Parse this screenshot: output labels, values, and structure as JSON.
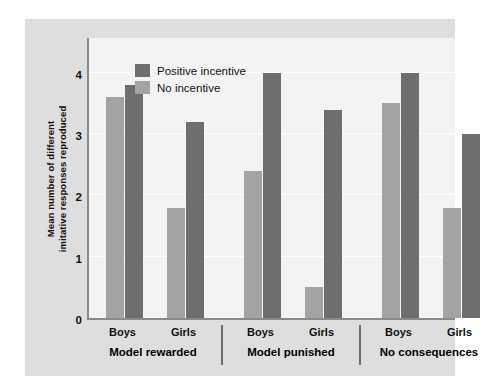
{
  "chart_data": {
    "type": "bar",
    "title": "",
    "subtitle": "",
    "xlabel": "",
    "ylabel_line1": "Mean number of different",
    "ylabel_line2": "imitative responses reproduced",
    "ylim": [
      0,
      4.6
    ],
    "yticks": [
      0,
      1,
      2,
      3,
      4
    ],
    "ytick_labels": [
      "0",
      "1",
      "2",
      "3",
      "4"
    ],
    "grid": true,
    "legend_position": "top-left",
    "colors": {
      "positive_incentive": "#6e6e6e",
      "no_incentive": "#a3a3a3",
      "plot_background": "#f3f3f3",
      "card_background": "#dedede",
      "axis": "#8a8a8a",
      "text": "#111111"
    },
    "legend": [
      {
        "name": "Positive incentive",
        "color": "#6e6e6e"
      },
      {
        "name": "No incentive",
        "color": "#a3a3a3"
      }
    ],
    "series": [
      {
        "name": "No incentive",
        "values": [
          3.6,
          1.8,
          2.4,
          0.5,
          3.5,
          1.8
        ]
      },
      {
        "name": "Positive incentive",
        "values": [
          3.8,
          3.2,
          4.0,
          3.4,
          4.0,
          3.0
        ]
      }
    ],
    "categories": [
      "Boys",
      "Girls",
      "Boys",
      "Girls",
      "Boys",
      "Girls"
    ],
    "groups": [
      {
        "label": "Model rewarded",
        "bars": [
          {
            "category": "Boys",
            "no_incentive": 3.6,
            "positive_incentive": 3.8
          },
          {
            "category": "Girls",
            "no_incentive": 1.8,
            "positive_incentive": 3.2
          }
        ]
      },
      {
        "label": "Model punished",
        "bars": [
          {
            "category": "Boys",
            "no_incentive": 2.4,
            "positive_incentive": 4.0
          },
          {
            "category": "Girls",
            "no_incentive": 0.5,
            "positive_incentive": 3.4
          }
        ]
      },
      {
        "label": "No consequences",
        "bars": [
          {
            "category": "Boys",
            "no_incentive": 3.5,
            "positive_incentive": 4.0
          },
          {
            "category": "Girls",
            "no_incentive": 1.8,
            "positive_incentive": 3.0
          }
        ]
      }
    ]
  }
}
